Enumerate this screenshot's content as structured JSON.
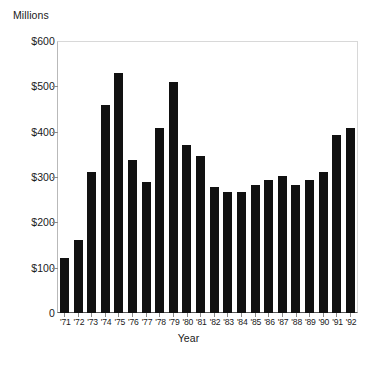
{
  "chart_data": {
    "type": "bar",
    "title": "",
    "subtitle": "",
    "xlabel": "Year",
    "ylabel": "Millions",
    "categories": [
      "'71",
      "'72",
      "'73",
      "'74",
      "'75",
      "'76",
      "'77",
      "'78",
      "'79",
      "'80",
      "'81",
      "'82",
      "'83",
      "'84",
      "'85",
      "'86",
      "'87",
      "'88",
      "'89",
      "'90",
      "'91",
      "'92"
    ],
    "values": [
      121,
      161,
      312,
      459,
      529,
      338,
      289,
      409,
      509,
      370,
      347,
      279,
      268,
      266,
      282,
      293,
      302,
      283,
      293,
      311,
      393,
      409
    ],
    "series": [
      {
        "name": "Millions",
        "values": [
          121,
          161,
          312,
          459,
          529,
          338,
          289,
          409,
          509,
          370,
          347,
          279,
          268,
          266,
          282,
          293,
          302,
          283,
          293,
          311,
          393,
          409
        ]
      }
    ],
    "ylim": [
      0,
      600
    ],
    "yticks": [
      0,
      100,
      200,
      300,
      400,
      500,
      600
    ],
    "ytick_labels": [
      "0",
      "$100",
      "$200",
      "$300",
      "$400",
      "$500",
      "$600"
    ],
    "grid": false,
    "legend": false,
    "bar_color": "#111111",
    "background_color": "#ffffff"
  }
}
